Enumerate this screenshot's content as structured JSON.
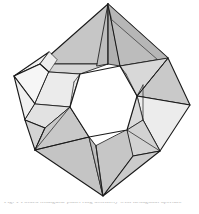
{
  "figure": {
    "background_color": "#ffffff",
    "stroke_color": "#1a1a1a",
    "canvas": {
      "width": 199,
      "height": 214
    },
    "palette": {
      "white": "#fdfdfd",
      "near_white": "#f4f4f4",
      "light": "#e8e8e8",
      "light_mid": "#dcdcdc",
      "mid": "#cfcfcf",
      "mid_dark": "#c2c2c2",
      "dark": "#b4b4b4",
      "darker": "#a8a8a8",
      "hole": "#ffffff"
    },
    "stroke_widths": {
      "outline": 1.15,
      "crease": 0.85,
      "thin": 0.6
    },
    "key_vertices": {
      "top_apex": [
        108,
        4
      ],
      "left_vertex": [
        14,
        76
      ],
      "right_vertex": [
        190,
        105
      ],
      "bottom_vertex": [
        103,
        196
      ],
      "lower_left_hub": [
        35,
        150
      ],
      "upper_left_wing": [
        49,
        52
      ],
      "upper_right_wing": [
        168,
        58
      ],
      "lower_right_hub": [
        160,
        151
      ]
    },
    "hexagon_hole": [
      [
        80,
        74
      ],
      [
        120,
        66
      ],
      [
        137,
        96
      ],
      [
        127,
        130
      ],
      [
        89,
        137
      ],
      [
        70,
        107
      ]
    ],
    "face_count": 24,
    "symmetry": "3-fold rotational"
  },
  "caption": {
    "text": "Fig. 1  Folded triangular panel ring assembly with hexagonal aperture"
  }
}
